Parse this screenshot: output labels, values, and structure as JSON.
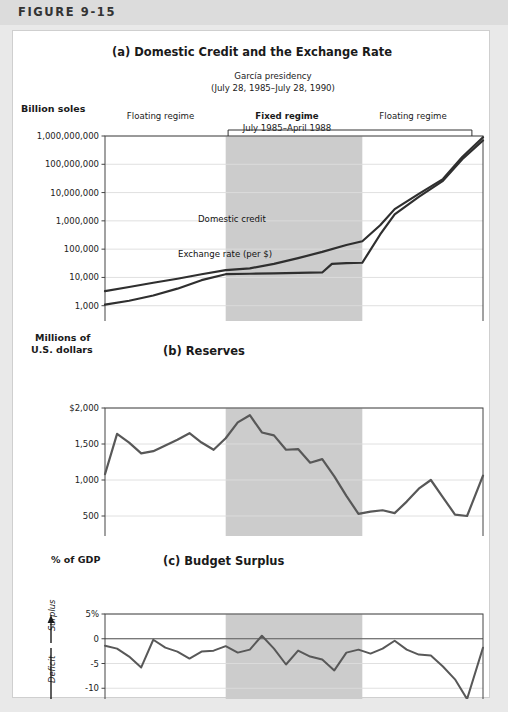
{
  "figure": {
    "label": "FIGURE 9-15",
    "colors": {
      "page_bg": "#e9e9e9",
      "header_band": "#dcdcdc",
      "card_bg": "#ffffff",
      "shade": "#cccccc",
      "line": "#585858",
      "line_dark": "#2f2f2f",
      "grid": "#dddddd",
      "axis": "#555555"
    }
  },
  "panel_a": {
    "title": "(a) Domestic Credit and the Exchange Rate",
    "presidency_line1": "García presidency",
    "presidency_line2": "(July 28, 1985–July 28, 1990)",
    "y_axis_title": "Billion soles",
    "regime_left": "Floating regime",
    "regime_right": "Floating regime",
    "regime_mid_line1": "Fixed regime",
    "regime_mid_line2": "July 1985–April 1988",
    "regime_mid_line3": "(with some realignments)",
    "series_label_credit": "Domestic credit",
    "series_label_exchange": "Exchange rate (per $)"
  },
  "panel_b": {
    "title": "(b) Reserves",
    "y_axis_title_line1": "Millions of",
    "y_axis_title_line2": "U.S. dollars"
  },
  "panel_c": {
    "title": "(c) Budget Surplus",
    "y_axis_title": "% of GDP",
    "surplus_label": "Surplus",
    "deficit_label": "Deficit"
  },
  "chart_data": [
    {
      "id": "panel_a",
      "type": "line",
      "title": "(a) Domestic Credit and the Exchange Rate",
      "xlabel": "",
      "ylabel": "Billion soles",
      "yscale": "log",
      "ylim": [
        100,
        1000000000
      ],
      "xlim": [
        1983.0,
        1990.83
      ],
      "grid": true,
      "y_ticks": [
        100,
        1000,
        10000,
        100000,
        1000000,
        10000000,
        100000000,
        1000000000
      ],
      "y_tick_labels": [
        "100",
        "1,000",
        "10,000",
        "100,000",
        "1,000,000",
        "10,000,000",
        "100,000,000",
        "1,000,000,000"
      ],
      "x_ticks": [
        1983,
        1984,
        1985,
        1986,
        1987,
        1988,
        1989,
        1990
      ],
      "x_tick_labels": [
        "1983",
        "1984",
        "1985",
        "1986",
        "1987",
        "1988",
        "1989",
        "1990"
      ],
      "shaded_region": {
        "start": 1985.5,
        "end": 1988.33,
        "label": "Fixed regime"
      },
      "series": [
        {
          "name": "Domestic credit",
          "x": [
            1983.0,
            1983.5,
            1984.0,
            1984.5,
            1985.0,
            1985.5,
            1986.0,
            1986.5,
            1987.0,
            1987.5,
            1988.0,
            1988.33,
            1988.7,
            1989.0,
            1989.5,
            1990.0,
            1990.4,
            1990.83
          ],
          "y": [
            3300,
            4600,
            6500,
            9000,
            13000,
            18000,
            21000,
            30000,
            48000,
            80000,
            140000,
            190000,
            700000,
            2600000,
            9000000,
            30000000,
            180000000,
            900000000
          ]
        },
        {
          "name": "Exchange rate (per $)",
          "x": [
            1983.0,
            1983.5,
            1984.0,
            1984.5,
            1985.0,
            1985.5,
            1986.0,
            1986.5,
            1987.0,
            1987.5,
            1987.7,
            1988.0,
            1988.33,
            1988.7,
            1989.0,
            1989.5,
            1990.0,
            1990.4,
            1990.83
          ],
          "y": [
            1100,
            1500,
            2300,
            4000,
            8000,
            13000,
            13500,
            14000,
            14500,
            15000,
            30000,
            32000,
            33000,
            330000,
            1700000,
            7000000,
            26000000,
            150000000,
            700000000
          ]
        }
      ]
    },
    {
      "id": "panel_b",
      "type": "line",
      "title": "(b) Reserves",
      "xlabel": "",
      "ylabel": "Millions of U.S. dollars",
      "ylim": [
        0,
        2000
      ],
      "xlim": [
        1983.0,
        1990.83
      ],
      "grid": true,
      "y_ticks": [
        0,
        500,
        1000,
        1500,
        2000
      ],
      "y_tick_labels": [
        "0",
        "500",
        "1,000",
        "1,500",
        "$2,000"
      ],
      "x_ticks": [
        1983,
        1984,
        1985,
        1986,
        1987,
        1988,
        1989,
        1990
      ],
      "x_tick_labels": [
        "1983",
        "1984",
        "1985",
        "1986",
        "1987",
        "1988",
        "1989",
        "1990"
      ],
      "shaded_region": {
        "start": 1985.5,
        "end": 1988.33
      },
      "series": [
        {
          "name": "Reserves",
          "x": [
            1983.0,
            1983.25,
            1983.5,
            1983.75,
            1984.0,
            1984.25,
            1984.5,
            1984.75,
            1985.0,
            1985.25,
            1985.5,
            1985.75,
            1986.0,
            1986.25,
            1986.5,
            1986.75,
            1987.0,
            1987.25,
            1987.5,
            1987.75,
            1988.0,
            1988.25,
            1988.5,
            1988.75,
            1989.0,
            1989.25,
            1989.5,
            1989.75,
            1990.0,
            1990.25,
            1990.5,
            1990.83
          ],
          "y": [
            1080,
            1640,
            1520,
            1370,
            1400,
            1480,
            1560,
            1650,
            1520,
            1420,
            1580,
            1800,
            1900,
            1660,
            1620,
            1420,
            1430,
            1240,
            1290,
            1050,
            780,
            530,
            560,
            580,
            540,
            700,
            880,
            1000,
            760,
            520,
            500,
            1060
          ]
        }
      ]
    },
    {
      "id": "panel_c",
      "type": "line",
      "title": "(c) Budget Surplus",
      "xlabel": "",
      "ylabel": "% of GDP",
      "ylim": [
        -15,
        5
      ],
      "xlim": [
        1983.0,
        1990.83
      ],
      "grid": true,
      "y_ticks": [
        -15,
        -10,
        -5,
        0,
        5
      ],
      "y_tick_labels": [
        "-15",
        "-10",
        "-5",
        "0",
        "5%"
      ],
      "x_ticks": [
        1983,
        1984,
        1985,
        1986,
        1987,
        1988,
        1989,
        1990
      ],
      "x_tick_labels": [
        "1983",
        "1984",
        "1985",
        "1986",
        "1987",
        "1988",
        "1989",
        "1990"
      ],
      "shaded_region": {
        "start": 1985.5,
        "end": 1988.33
      },
      "zero_line": 0,
      "series": [
        {
          "name": "Budget surplus (% of GDP)",
          "x": [
            1983.0,
            1983.25,
            1983.5,
            1983.75,
            1984.0,
            1984.25,
            1984.5,
            1984.75,
            1985.0,
            1985.25,
            1985.5,
            1985.75,
            1986.0,
            1986.25,
            1986.5,
            1986.75,
            1987.0,
            1987.25,
            1987.5,
            1987.75,
            1988.0,
            1988.25,
            1988.5,
            1988.75,
            1989.0,
            1989.25,
            1989.5,
            1989.75,
            1990.0,
            1990.25,
            1990.5,
            1990.83
          ],
          "y": [
            -1.4,
            -2.0,
            -3.6,
            -5.8,
            -0.2,
            -1.8,
            -2.6,
            -4.0,
            -2.6,
            -2.4,
            -1.5,
            -2.8,
            -2.2,
            0.6,
            -2.0,
            -5.2,
            -2.4,
            -3.6,
            -4.2,
            -6.4,
            -2.8,
            -2.2,
            -3.0,
            -2.0,
            -0.4,
            -2.2,
            -3.2,
            -3.4,
            -5.6,
            -8.2,
            -12.2,
            -1.8
          ]
        }
      ]
    }
  ]
}
